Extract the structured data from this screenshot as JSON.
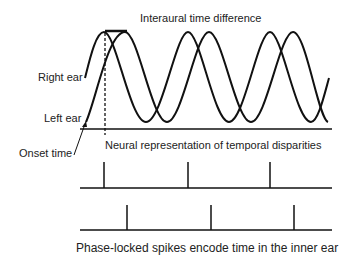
{
  "title": "Interaural time difference",
  "labels": {
    "right_ear": "Right ear",
    "left_ear": "Left ear",
    "onset_time": "Onset time",
    "neural": "Neural representation of temporal disparities",
    "caption": "Phase-locked spikes encode time in the inner ear"
  },
  "waves": {
    "right_ear": {
      "start_x": 85,
      "peaks_x": [
        104,
        188,
        270
      ]
    },
    "left_ear": {
      "start_x": 85,
      "peaks_x": [
        125,
        209,
        293
      ]
    }
  },
  "spike_trains": {
    "right_ear": {
      "baseline_y": 188,
      "spike_x": [
        104,
        188,
        270
      ]
    },
    "left_ear": {
      "baseline_y": 230,
      "spike_x": [
        127,
        211,
        294
      ]
    }
  },
  "colors": {
    "stroke": "#111111",
    "text": "#222222"
  }
}
